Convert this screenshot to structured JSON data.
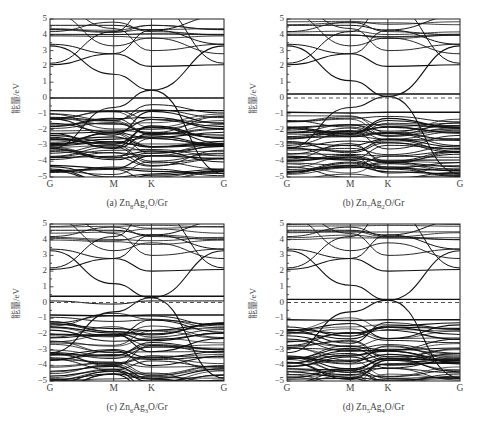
{
  "figure": {
    "panels": [
      {
        "id": "a",
        "caption_prefix": "(a) ",
        "formula": [
          [
            "Zn",
            ""
          ],
          [
            "",
            "8"
          ],
          [
            "Ag",
            ""
          ],
          [
            "",
            "1"
          ],
          [
            "O/Gr",
            ""
          ]
        ]
      },
      {
        "id": "b",
        "caption_prefix": "(b) ",
        "formula": [
          [
            "Zn",
            ""
          ],
          [
            "",
            "7"
          ],
          [
            "Ag",
            ""
          ],
          [
            "",
            "2"
          ],
          [
            "O/Gr",
            ""
          ]
        ]
      },
      {
        "id": "c",
        "caption_prefix": "(c) ",
        "formula": [
          [
            "Zn",
            ""
          ],
          [
            "",
            "6"
          ],
          [
            "Ag",
            ""
          ],
          [
            "",
            "3"
          ],
          [
            "O/Gr",
            ""
          ]
        ]
      },
      {
        "id": "d",
        "caption_prefix": "(d) ",
        "formula": [
          [
            "Zn",
            ""
          ],
          [
            "",
            "5"
          ],
          [
            "Ag",
            ""
          ],
          [
            "",
            "4"
          ],
          [
            "O/Gr",
            ""
          ]
        ]
      }
    ]
  },
  "chart_data": [
    {
      "type": "line",
      "title": "(a) Zn8Ag1O/Gr",
      "xlabel": "",
      "ylabel": "能量/eV",
      "x_ticks": [
        "G",
        "M",
        "K",
        "G"
      ],
      "x_tick_positions": [
        0,
        0.366,
        0.583,
        1.0
      ],
      "yticks": [
        -5,
        -4,
        -3,
        -2,
        -1,
        0,
        1,
        2,
        3,
        4,
        5
      ],
      "ylim": [
        -5,
        5
      ],
      "fermi_level": 0,
      "fermi_style": "dashed",
      "grid": false,
      "description": "Band structure; dense valence bands from -1.2 to -5 eV, flat band near 0 eV, Dirac-like crossing at K near 0.5 eV",
      "notable_points": {
        "K_dirac_eV": 0.5,
        "M_cone_eV": 1.5,
        "flat_band_eV": 0.0,
        "flat_band_2_eV": -0.8
      }
    },
    {
      "type": "line",
      "title": "(b) Zn7Ag2O/Gr",
      "xlabel": "",
      "ylabel": "能量/eV",
      "x_ticks": [
        "G",
        "M",
        "K",
        "G"
      ],
      "x_tick_positions": [
        0,
        0.366,
        0.583,
        1.0
      ],
      "yticks": [
        -5,
        -4,
        -3,
        -2,
        -1,
        0,
        1,
        2,
        3,
        4,
        5
      ],
      "ylim": [
        -5,
        5
      ],
      "fermi_level": 0,
      "fermi_style": "dashed",
      "grid": false,
      "description": "Band structure; Dirac crossing at K near 0.1 eV, flat band near 0.25 eV, dense valence bands below -0.9 eV",
      "notable_points": {
        "K_dirac_eV": 0.1,
        "M_cone_eV": 1.1,
        "flat_band_eV": 0.25,
        "flat_band_2_eV": -0.9
      }
    },
    {
      "type": "line",
      "title": "(c) Zn6Ag3O/Gr",
      "xlabel": "",
      "ylabel": "能量/eV",
      "x_ticks": [
        "G",
        "M",
        "K",
        "G"
      ],
      "x_tick_positions": [
        0,
        0.366,
        0.583,
        1.0
      ],
      "yticks": [
        -5,
        -4,
        -3,
        -2,
        -1,
        0,
        1,
        2,
        3,
        4,
        5
      ],
      "ylim": [
        -5,
        5
      ],
      "fermi_level": 0,
      "fermi_style": "dashed",
      "grid": false,
      "description": "Band structure; Dirac crossing at K near 0.3 eV, flat bands near 0.4 eV and 0.1 eV, dense valence bands below -0.8 eV",
      "notable_points": {
        "K_dirac_eV": 0.3,
        "M_cone_eV": 1.2,
        "flat_band_eV": 0.4,
        "flat_band_2_eV": -0.8
      }
    },
    {
      "type": "line",
      "title": "(d) Zn5Ag4O/Gr",
      "xlabel": "",
      "ylabel": "能量/eV",
      "x_ticks": [
        "G",
        "M",
        "K",
        "G"
      ],
      "x_tick_positions": [
        0,
        0.366,
        0.583,
        1.0
      ],
      "yticks": [
        -5,
        -4,
        -3,
        -2,
        -1,
        0,
        1,
        2,
        3,
        4,
        5
      ],
      "ylim": [
        -5,
        5
      ],
      "fermi_level": 0,
      "fermi_style": "dashed",
      "grid": false,
      "description": "Band structure; Dirac crossing at K near 0.15 eV, flat bands near 0.2 and 0.1 eV, dense valence bands below -1.0 eV",
      "notable_points": {
        "K_dirac_eV": 0.15,
        "M_cone_eV": 1.1,
        "flat_band_eV": 0.2,
        "flat_band_2_eV": -1.1
      }
    }
  ]
}
